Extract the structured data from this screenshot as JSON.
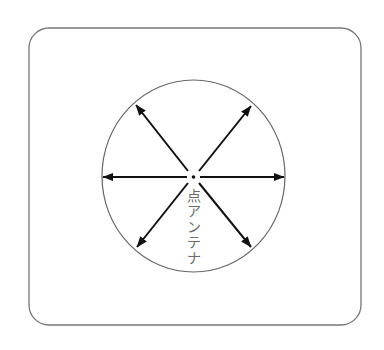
{
  "diagram": {
    "title": "",
    "label": "点アンテナ",
    "label_chars": [
      "点",
      "ア",
      "ン",
      "テ",
      "ナ"
    ],
    "caption_meaning": "point antenna",
    "arrow_directions": [
      "left",
      "right",
      "upper-left",
      "upper-right",
      "lower-left",
      "lower-right"
    ],
    "colors": {
      "background": "#ffffff",
      "frame_stroke": "#777777",
      "circle_stroke": "#666666",
      "arrow": "#111111",
      "label": "#6a6a6a"
    }
  }
}
